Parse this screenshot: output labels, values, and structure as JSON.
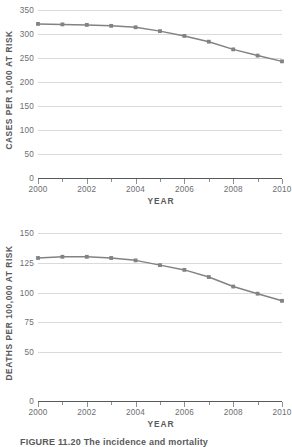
{
  "figure": {
    "caption": "FIGURE 11.20  The incidence and mortality"
  },
  "chart_data": [
    {
      "id": "cases",
      "type": "line",
      "title": "",
      "xlabel": "YEAR",
      "ylabel": "CASES PER 1,000 AT RISK",
      "x": [
        2000,
        2001,
        2002,
        2003,
        2004,
        2005,
        2006,
        2007,
        2008,
        2009,
        2010
      ],
      "values": [
        321,
        320,
        319,
        317,
        314,
        306,
        296,
        284,
        268,
        255,
        243
      ],
      "xlim": [
        2000,
        2010
      ],
      "ylim": [
        0,
        350
      ],
      "yticks": [
        0,
        50,
        100,
        150,
        200,
        250,
        300,
        350
      ],
      "ytick_labels": [
        "0",
        "50",
        "100",
        "150",
        "200",
        "250",
        "300",
        "350"
      ],
      "xticks": [
        2000,
        2002,
        2004,
        2006,
        2008,
        2010
      ],
      "xtick_labels": [
        "2000",
        "2002",
        "2004",
        "2006",
        "2008",
        "2010"
      ],
      "xminor_ticks": [
        2001,
        2003,
        2005,
        2007,
        2009
      ],
      "grid": true,
      "legend": "none",
      "line_color": "#808285",
      "marker_color": "#808285",
      "grid_color": "#d9dadb",
      "axis_color": "#58595b"
    },
    {
      "id": "deaths",
      "type": "line",
      "title": "",
      "xlabel": "YEAR",
      "ylabel": "DEATHS PER 100,000 AT RISK",
      "x": [
        2000,
        2001,
        2002,
        2003,
        2004,
        2005,
        2006,
        2007,
        2008,
        2009,
        2010
      ],
      "values": [
        129,
        130,
        130,
        129,
        127,
        123,
        119,
        113,
        105,
        99,
        93
      ],
      "xlim": [
        2000,
        2010
      ],
      "ylim": [
        0,
        150
      ],
      "yticks": [
        0,
        50,
        75,
        100,
        125,
        150
      ],
      "ytick_labels": [
        "0",
        "50",
        "75",
        "100",
        "125",
        "150"
      ],
      "xticks": [
        2000,
        2002,
        2004,
        2006,
        2008,
        2010
      ],
      "xtick_labels": [
        "2000",
        "2002",
        "2004",
        "2006",
        "2008",
        "2010"
      ],
      "xminor_ticks": [
        2001,
        2003,
        2005,
        2007,
        2009
      ],
      "grid": true,
      "legend": "none",
      "line_color": "#808285",
      "marker_color": "#808285",
      "grid_color": "#d9dadb",
      "axis_color": "#58595b"
    }
  ]
}
